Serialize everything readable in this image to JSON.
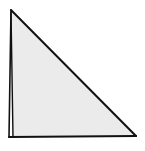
{
  "diagram": {
    "shape": "right-triangle",
    "fill": "#ebebeb",
    "stroke": "#111111",
    "vertices": {
      "top": [
        11,
        10
      ],
      "bottom_left": [
        12,
        137
      ],
      "bottom_right": [
        136,
        137
      ]
    }
  }
}
